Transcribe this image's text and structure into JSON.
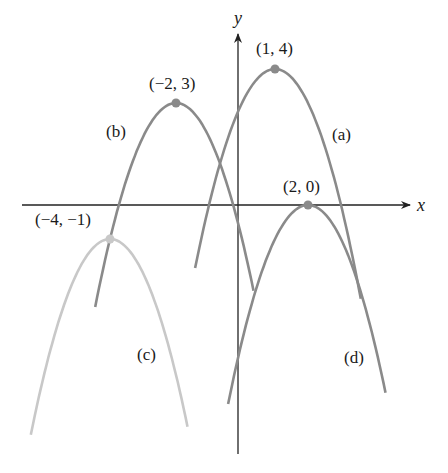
{
  "figure": {
    "axes": {
      "x_label": "x",
      "y_label": "y",
      "origin_px": [
        242,
        205
      ],
      "unit_px": [
        33,
        34
      ]
    },
    "colors": {
      "axis": "#222222",
      "curve_dark": "#8a8a8a",
      "curve_light": "#c8c8c8",
      "vertex_dark": "#8a8a8a",
      "vertex_light": "#c8c8c8"
    },
    "curves": [
      {
        "id": "a",
        "label": "(a)",
        "vertex": [
          1,
          4
        ],
        "vertex_label": "(1, 4)",
        "x_range": [
          -1.42,
          3.6
        ],
        "equation": "y = -(x-1)^2 + 4"
      },
      {
        "id": "b",
        "label": "(b)",
        "vertex": [
          -2,
          3
        ],
        "vertex_label": "(−2, 3)",
        "x_range": [
          -4.45,
          0.35
        ],
        "equation": "y = -(x+2)^2 + 3"
      },
      {
        "id": "c",
        "label": "(c)",
        "vertex": [
          -4,
          -1
        ],
        "vertex_label": "(−4, −1)",
        "x_range": [
          -6.4,
          -1.65
        ],
        "equation": "y = -(x+4)^2 - 1"
      },
      {
        "id": "d",
        "label": "(d)",
        "vertex": [
          2,
          0
        ],
        "vertex_label": "(2, 0)",
        "x_range": [
          -0.42,
          4.35
        ],
        "equation": "y = -(x-2)^2"
      }
    ]
  }
}
